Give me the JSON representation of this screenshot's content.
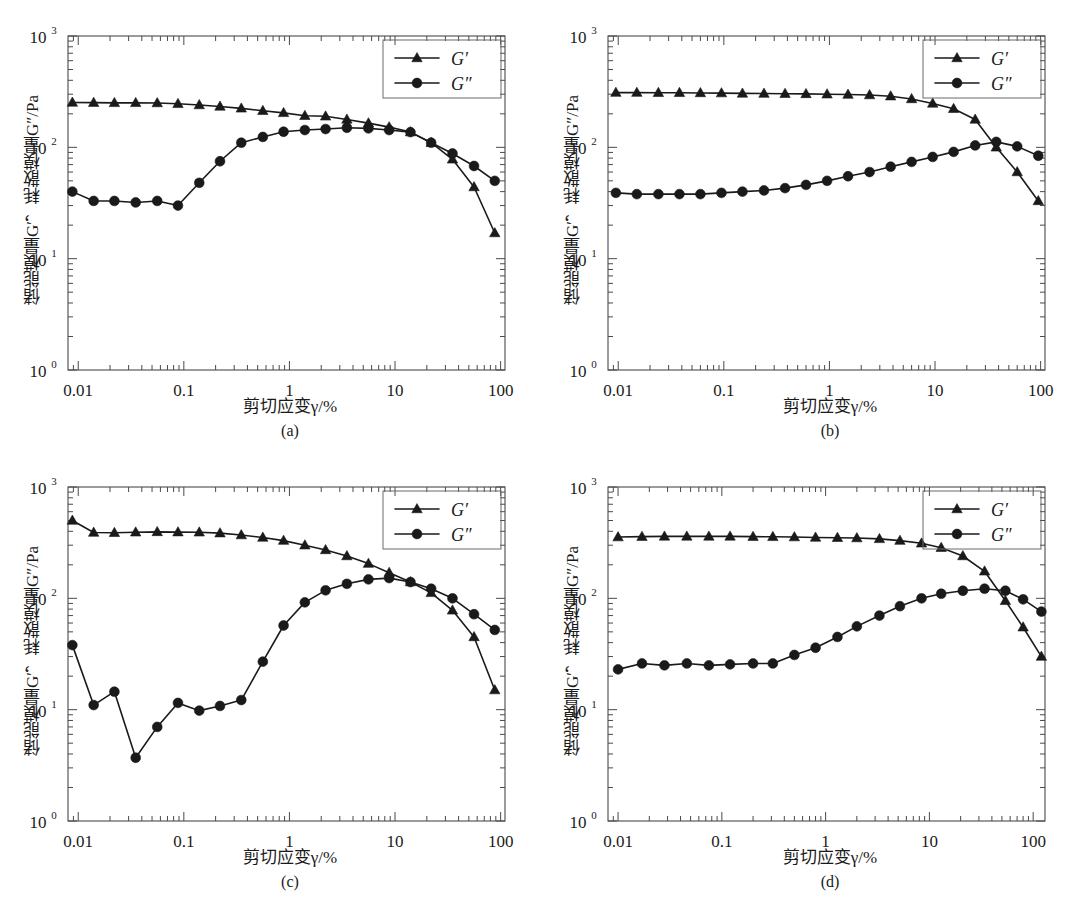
{
  "figure": {
    "panels": [
      {
        "id": "a",
        "caption": "(a)"
      },
      {
        "id": "b",
        "caption": "(b)"
      },
      {
        "id": "c",
        "caption": "(c)"
      },
      {
        "id": "d",
        "caption": "(d)"
      }
    ],
    "shared": {
      "ylabel": "储能模量G′，耗散模量G″/Pa",
      "xlabel": "剪切应变γ/%",
      "legend": [
        "G′",
        "G″"
      ],
      "xtick_labels": [
        "0.01",
        "0.1",
        "1",
        "10",
        "100"
      ],
      "ytick_labels": [
        "10⁰",
        "10¹",
        "10²",
        "10³"
      ],
      "line_color": "#1a1a1a",
      "axis_color": "#4a4a4a"
    }
  },
  "chart_data": [
    {
      "type": "line",
      "panel": "a",
      "title": "(a)",
      "xlabel": "剪切应变γ/%",
      "ylabel": "储能模量G′，耗散模量G″/Pa",
      "xscale": "log",
      "yscale": "log",
      "xlim": [
        0.008,
        110
      ],
      "ylim": [
        1,
        1000
      ],
      "grid": false,
      "legend_position": "top-right",
      "series": [
        {
          "name": "G′",
          "marker": "triangle",
          "x": [
            0.0088,
            0.014,
            0.022,
            0.035,
            0.056,
            0.088,
            0.14,
            0.22,
            0.35,
            0.56,
            0.88,
            1.4,
            2.2,
            3.5,
            5.6,
            8.8,
            14,
            22,
            35,
            56,
            88
          ],
          "y": [
            253,
            252,
            251,
            251,
            250,
            246,
            240,
            233,
            224,
            213,
            204,
            192,
            190,
            178,
            165,
            152,
            137,
            110,
            78,
            44,
            17
          ]
        },
        {
          "name": "G″",
          "marker": "circle",
          "x": [
            0.0088,
            0.014,
            0.022,
            0.035,
            0.056,
            0.088,
            0.14,
            0.22,
            0.35,
            0.56,
            0.88,
            1.4,
            2.2,
            3.5,
            5.6,
            8.8,
            14,
            22,
            35,
            56,
            88
          ],
          "y": [
            40,
            33,
            33,
            32,
            33,
            30,
            48,
            75,
            110,
            124,
            138,
            143,
            146,
            150,
            148,
            143,
            137,
            110,
            88,
            68,
            50
          ]
        }
      ]
    },
    {
      "type": "line",
      "panel": "b",
      "title": "(b)",
      "xlabel": "剪切应变γ/%",
      "ylabel": "储能模量G′，耗散模量G″/Pa",
      "xscale": "log",
      "yscale": "log",
      "xlim": [
        0.008,
        110
      ],
      "ylim": [
        1,
        1000
      ],
      "grid": false,
      "legend_position": "top-right",
      "series": [
        {
          "name": "G′",
          "marker": "triangle",
          "x": [
            0.0095,
            0.015,
            0.024,
            0.038,
            0.06,
            0.095,
            0.15,
            0.24,
            0.38,
            0.6,
            0.95,
            1.5,
            2.4,
            3.8,
            6.0,
            9.5,
            15,
            24,
            38,
            60,
            95
          ],
          "y": [
            310,
            310,
            309,
            309,
            308,
            307,
            305,
            304,
            303,
            302,
            300,
            298,
            295,
            288,
            272,
            248,
            222,
            178,
            100,
            60,
            33
          ]
        },
        {
          "name": "G″",
          "marker": "circle",
          "x": [
            0.0095,
            0.015,
            0.024,
            0.038,
            0.06,
            0.095,
            0.15,
            0.24,
            0.38,
            0.6,
            0.95,
            1.5,
            2.4,
            3.8,
            6.0,
            9.5,
            15,
            24,
            38,
            60,
            95
          ],
          "y": [
            39,
            38,
            38,
            38,
            38,
            39,
            40,
            41,
            43,
            46,
            50,
            55,
            60,
            67,
            74,
            82,
            91,
            104,
            112,
            102,
            84
          ]
        }
      ]
    },
    {
      "type": "line",
      "panel": "c",
      "title": "(c)",
      "xlabel": "剪切应变γ/%",
      "ylabel": "储能模量G′，耗散模量G″/Pa",
      "xscale": "log",
      "yscale": "log",
      "xlim": [
        0.008,
        110
      ],
      "ylim": [
        1,
        1000
      ],
      "grid": false,
      "legend_position": "top-right",
      "series": [
        {
          "name": "G′",
          "marker": "triangle",
          "x": [
            0.0088,
            0.014,
            0.022,
            0.035,
            0.056,
            0.088,
            0.14,
            0.22,
            0.35,
            0.56,
            0.88,
            1.4,
            2.2,
            3.5,
            5.6,
            8.8,
            14,
            22,
            35,
            56,
            88
          ],
          "y": [
            500,
            390,
            388,
            392,
            395,
            393,
            392,
            385,
            370,
            352,
            330,
            300,
            272,
            240,
            205,
            170,
            140,
            112,
            78,
            45,
            15
          ]
        },
        {
          "name": "G″",
          "marker": "circle",
          "x": [
            0.0088,
            0.014,
            0.022,
            0.035,
            0.056,
            0.088,
            0.14,
            0.22,
            0.35,
            0.56,
            0.88,
            1.4,
            2.2,
            3.5,
            5.6,
            8.8,
            14,
            22,
            35,
            56,
            88
          ],
          "y": [
            38,
            11,
            14.5,
            3.7,
            7,
            11.5,
            9.8,
            10.8,
            12.2,
            27,
            57,
            92,
            118,
            135,
            148,
            152,
            140,
            122,
            100,
            72,
            52
          ]
        }
      ]
    },
    {
      "type": "line",
      "panel": "d",
      "title": "(d)",
      "xlabel": "剪切应变γ/%",
      "ylabel": "储能模量G′，耗散模量G″/Pa",
      "xscale": "log",
      "yscale": "log",
      "xlim": [
        0.008,
        130
      ],
      "ylim": [
        1,
        1000
      ],
      "grid": false,
      "legend_position": "top-right",
      "series": [
        {
          "name": "G′",
          "marker": "triangle",
          "x": [
            0.01,
            0.017,
            0.028,
            0.046,
            0.075,
            0.12,
            0.2,
            0.31,
            0.5,
            0.8,
            1.3,
            2.0,
            3.3,
            5.2,
            8.4,
            13,
            21,
            34,
            54,
            80,
            120
          ],
          "y": [
            355,
            358,
            360,
            360,
            360,
            360,
            358,
            357,
            355,
            352,
            350,
            348,
            342,
            330,
            312,
            285,
            240,
            175,
            95,
            55,
            30
          ]
        },
        {
          "name": "G″",
          "marker": "circle",
          "x": [
            0.01,
            0.017,
            0.028,
            0.046,
            0.075,
            0.12,
            0.2,
            0.31,
            0.5,
            0.8,
            1.3,
            2.0,
            3.3,
            5.2,
            8.4,
            13,
            21,
            34,
            54,
            80,
            120
          ],
          "y": [
            23,
            26,
            25,
            26,
            25,
            25.5,
            26,
            26,
            31,
            36,
            45,
            56,
            70,
            85,
            100,
            110,
            117,
            122,
            117,
            98,
            76
          ]
        }
      ]
    }
  ]
}
